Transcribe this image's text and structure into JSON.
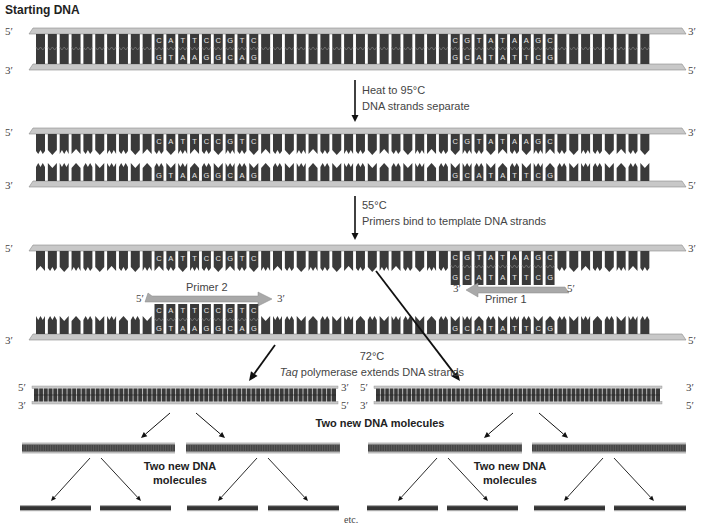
{
  "title": "Starting DNA",
  "colors": {
    "backbone": "#c8c8c8",
    "backbone_edge": "#8a8a8a",
    "base": "#3a3a3a",
    "base_letter": "#e8e8e8",
    "primer": "#a9a9a9",
    "arrow": "#111111"
  },
  "sequences": {
    "region1_top": [
      "C",
      "A",
      "T",
      "T",
      "C",
      "C",
      "G",
      "T",
      "C"
    ],
    "region1_bottom": [
      "G",
      "T",
      "A",
      "A",
      "G",
      "G",
      "C",
      "A",
      "G"
    ],
    "region2_top": [
      "C",
      "G",
      "T",
      "A",
      "T",
      "A",
      "A",
      "G",
      "C"
    ],
    "region2_bottom": [
      "G",
      "C",
      "A",
      "T",
      "A",
      "T",
      "T",
      "C",
      "G"
    ]
  },
  "ends": {
    "five": "5′",
    "three": "3′"
  },
  "steps": {
    "denature": {
      "line1": "Heat to 95°C",
      "line2": "DNA strands separate"
    },
    "anneal": {
      "line1": "55°C",
      "line2": "Primers bind to template DNA strands"
    },
    "extend": {
      "line1": "72°C",
      "line2_italic": "Taq",
      "line2_rest": " polymerase extends DNA strands"
    }
  },
  "primers": {
    "primer1": "Primer 1",
    "primer2": "Primer 2"
  },
  "labels": {
    "two_new_molecules": "Two new DNA molecules",
    "two_new_dna": "Two new DNA",
    "molecules": "molecules",
    "etc": "etc."
  }
}
